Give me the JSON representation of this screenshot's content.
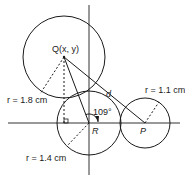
{
  "diagram": {
    "points": {
      "Q": {
        "label": "Q(x, y)"
      },
      "R": {
        "label": "R"
      },
      "P": {
        "label": "P"
      }
    },
    "labels": {
      "distance": "d",
      "angle": "109°",
      "r_q": "r = 1.8 cm",
      "r_r": "r = 1.4 cm",
      "r_p": "r = 1.1 cm"
    },
    "circles": [
      {
        "center": "Q",
        "radius_cm": 1.8
      },
      {
        "center": "R",
        "radius_cm": 1.4
      },
      {
        "center": "P",
        "radius_cm": 1.1
      }
    ],
    "angle_QRP_deg": 109,
    "colors": {
      "stroke": "#1a1a1a",
      "background": "#ffffff"
    }
  }
}
